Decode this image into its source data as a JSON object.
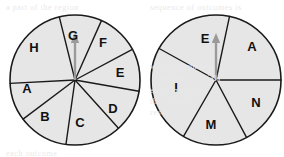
{
  "figure": {
    "background_color": "#ffffff",
    "sector_fill_color": "#e6e6e6",
    "sector_line_color": "#1a1a1a",
    "label_color": "#111111",
    "arrow_color": "#9a9a9a"
  },
  "spinners": [
    {
      "id": "spinner-left",
      "name": "left-spinner",
      "center_x": 75,
      "center_y": 80,
      "radius": 65,
      "sector_count": 8,
      "pointer": {
        "name": "arrow-pointer",
        "direction": "up",
        "angle_deg": 90,
        "length": 46
      },
      "sectors": [
        {
          "label": "G",
          "start_deg": 66,
          "end_deg": 104,
          "label_x": 73,
          "label_y": 37
        },
        {
          "label": "F",
          "start_deg": 28,
          "end_deg": 66,
          "label_x": 103,
          "label_y": 44
        },
        {
          "label": "E",
          "start_deg": -10,
          "end_deg": 28,
          "label_x": 120,
          "label_y": 74
        },
        {
          "label": "D",
          "start_deg": -48,
          "end_deg": -10,
          "label_x": 113,
          "label_y": 110
        },
        {
          "label": "C",
          "start_deg": -98,
          "end_deg": -48,
          "label_x": 80,
          "label_y": 124
        },
        {
          "label": "B",
          "start_deg": -143,
          "end_deg": -98,
          "label_x": 45,
          "label_y": 118
        },
        {
          "label": "A",
          "start_deg": 183,
          "end_deg": 217,
          "label_x": 27,
          "label_y": 90
        },
        {
          "label": "H",
          "start_deg": 104,
          "end_deg": 183,
          "label_x": 34,
          "label_y": 49
        }
      ]
    },
    {
      "id": "spinner-right",
      "name": "right-spinner",
      "center_x": 216,
      "center_y": 80,
      "radius": 65,
      "sector_count": 5,
      "pointer": {
        "name": "arrow-pointer",
        "direction": "up",
        "angle_deg": 90,
        "length": 46
      },
      "sectors": [
        {
          "label": "E",
          "start_deg": 78,
          "end_deg": 151,
          "label_x": 205,
          "label_y": 40
        },
        {
          "label": "A",
          "start_deg": 0,
          "end_deg": 78,
          "label_x": 252,
          "label_y": 48
        },
        {
          "label": "N",
          "start_deg": -62,
          "end_deg": 0,
          "label_x": 256,
          "label_y": 104
        },
        {
          "label": "M",
          "start_deg": -120,
          "end_deg": -62,
          "label_x": 211,
          "label_y": 126
        },
        {
          "label": "I",
          "start_deg": 151,
          "end_deg": 240,
          "label_x": 176,
          "label_y": 89
        }
      ]
    }
  ],
  "background_ghost_lines": [
    {
      "text": "sequence of outcomes is",
      "x": 150,
      "y": 3
    },
    {
      "text": "a part of the region",
      "x": 6,
      "y": 3
    },
    {
      "text": "with the numbers",
      "x": 150,
      "y": 62
    },
    {
      "text": "number of trials",
      "x": 160,
      "y": 74
    },
    {
      "text": "experiment in",
      "x": 150,
      "y": 86
    },
    {
      "text": "the spinner",
      "x": 150,
      "y": 97
    },
    {
      "text": "results",
      "x": 150,
      "y": 108
    },
    {
      "text": "each outcome",
      "x": 6,
      "y": 149
    }
  ]
}
